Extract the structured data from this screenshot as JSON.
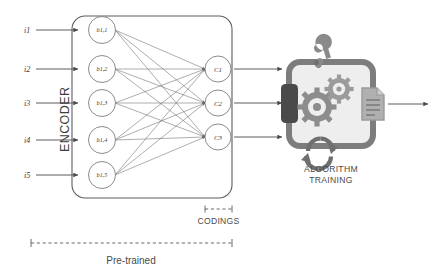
{
  "diagram": {
    "inputs": [
      {
        "id": "i1",
        "label": "i1"
      },
      {
        "id": "i2",
        "label": "i2"
      },
      {
        "id": "i3",
        "label": "i3"
      },
      {
        "id": "i4",
        "label": "i4"
      },
      {
        "id": "i5",
        "label": "i5"
      }
    ],
    "hidden_nodes": [
      {
        "id": "b11",
        "label": "b1,1"
      },
      {
        "id": "b12",
        "label": "b1,2"
      },
      {
        "id": "b13",
        "label": "b1,3"
      },
      {
        "id": "b14",
        "label": "b1,4"
      },
      {
        "id": "b15",
        "label": "b1,5"
      }
    ],
    "coding_nodes": [
      {
        "id": "c1",
        "label": "C1"
      },
      {
        "id": "c2",
        "label": "C2"
      },
      {
        "id": "c3",
        "label": "C3"
      }
    ],
    "encoder_label": "ENCODER",
    "codings_label": "CODINGS",
    "pretrained_label": "Pre-trained",
    "algorithm_label_line1": "ALGORITHM",
    "algorithm_label_line2": "TRAINING",
    "icons": {
      "wrench": "wrench-icon",
      "gear_large": "gear-icon",
      "gear_small": "gear-icon",
      "refresh": "circular-arrow-icon",
      "document": "document-icon",
      "input_port": "input-port-icon"
    },
    "colors": {
      "stroke": "#5d5d5d",
      "link": "#6b6b6b",
      "node_fill": "#ffffff",
      "gray_dark": "#4a4a4a",
      "gray_mid": "#7d7d7d",
      "gray_light": "#b4b4b4",
      "panel_fill": "#eeeeee",
      "background": "#ffffff"
    }
  }
}
